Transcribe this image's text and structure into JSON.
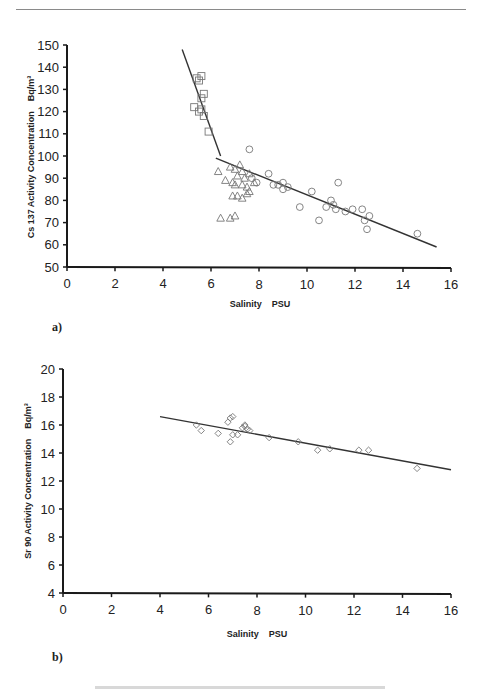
{
  "chart_data": [
    {
      "panel": "a)",
      "type": "scatter",
      "title": "",
      "xlabel": "Salinity    PSU",
      "ylabel": "Cs 137 Activity Concentration    Bq/m³",
      "xlim": [
        0,
        16
      ],
      "ylim": [
        50,
        150
      ],
      "xticks": [
        0,
        2,
        4,
        6,
        8,
        10,
        12,
        14,
        16
      ],
      "yticks": [
        50,
        60,
        70,
        80,
        90,
        100,
        110,
        120,
        130,
        140,
        150
      ],
      "grid": false,
      "legend": null,
      "series": [
        {
          "name": "squares",
          "marker": "square",
          "points": [
            [
              5.4,
              135
            ],
            [
              5.6,
              136
            ],
            [
              5.5,
              134
            ],
            [
              5.7,
              128
            ],
            [
              5.6,
              126
            ],
            [
              5.3,
              122
            ],
            [
              5.5,
              120
            ],
            [
              5.6,
              121
            ],
            [
              5.7,
              118
            ],
            [
              5.9,
              111
            ]
          ]
        },
        {
          "name": "triangles",
          "marker": "triangle",
          "points": [
            [
              6.3,
              93
            ],
            [
              6.8,
              95
            ],
            [
              7.0,
              94
            ],
            [
              7.2,
              96
            ],
            [
              7.3,
              93
            ],
            [
              6.6,
              89
            ],
            [
              6.9,
              88
            ],
            [
              7.0,
              87
            ],
            [
              7.3,
              87
            ],
            [
              7.5,
              86
            ],
            [
              6.4,
              72
            ],
            [
              6.8,
              72
            ],
            [
              7.0,
              73
            ],
            [
              7.1,
              82
            ],
            [
              7.3,
              81
            ],
            [
              7.5,
              83
            ],
            [
              6.9,
              82
            ],
            [
              7.6,
              84
            ],
            [
              7.8,
              88
            ],
            [
              7.1,
              91
            ],
            [
              7.6,
              92
            ],
            [
              7.4,
              90
            ]
          ]
        },
        {
          "name": "circles",
          "marker": "circle",
          "points": [
            [
              7.6,
              103
            ],
            [
              7.7,
              90
            ],
            [
              7.9,
              88
            ],
            [
              8.4,
              92
            ],
            [
              8.6,
              87
            ],
            [
              8.8,
              87
            ],
            [
              9.0,
              88
            ],
            [
              9.2,
              86
            ],
            [
              9.7,
              77
            ],
            [
              10.2,
              84
            ],
            [
              10.5,
              71
            ],
            [
              10.8,
              77
            ],
            [
              11.0,
              80
            ],
            [
              11.1,
              78
            ],
            [
              11.3,
              88
            ],
            [
              11.2,
              76
            ],
            [
              11.6,
              75
            ],
            [
              11.9,
              76
            ],
            [
              12.3,
              76
            ],
            [
              12.4,
              71
            ],
            [
              12.6,
              73
            ],
            [
              12.5,
              67
            ],
            [
              14.6,
              65
            ],
            [
              9.0,
              85
            ]
          ]
        }
      ],
      "fit_lines": [
        {
          "name": "upper segment",
          "from": [
            4.8,
            148
          ],
          "to": [
            6.4,
            100
          ]
        },
        {
          "name": "lower segment",
          "from": [
            6.2,
            99
          ],
          "to": [
            15.4,
            59
          ]
        }
      ]
    },
    {
      "panel": "b)",
      "type": "scatter",
      "title": "",
      "xlabel": "Salinity    PSU",
      "ylabel": "Sr 90 Activity Concentration    Bq/m³",
      "xlim": [
        0,
        16
      ],
      "ylim": [
        4,
        20
      ],
      "xticks": [
        0,
        2,
        4,
        6,
        8,
        10,
        12,
        14,
        16
      ],
      "yticks": [
        4,
        6,
        8,
        10,
        12,
        14,
        16,
        18,
        20
      ],
      "grid": false,
      "legend": null,
      "series": [
        {
          "name": "diamonds",
          "marker": "diamond",
          "points": [
            [
              5.5,
              16.0
            ],
            [
              5.7,
              15.6
            ],
            [
              6.4,
              15.4
            ],
            [
              6.8,
              16.2
            ],
            [
              6.9,
              16.5
            ],
            [
              7.0,
              16.6
            ],
            [
              7.0,
              15.3
            ],
            [
              7.2,
              15.3
            ],
            [
              6.9,
              14.8
            ],
            [
              7.4,
              15.8
            ],
            [
              7.5,
              15.9
            ],
            [
              7.6,
              15.7
            ],
            [
              7.7,
              15.6
            ],
            [
              7.5,
              16.0
            ],
            [
              8.5,
              15.1
            ],
            [
              9.7,
              14.8
            ],
            [
              10.5,
              14.2
            ],
            [
              11.0,
              14.3
            ],
            [
              12.2,
              14.2
            ],
            [
              12.6,
              14.2
            ],
            [
              14.6,
              12.9
            ]
          ]
        }
      ],
      "fit_lines": [
        {
          "name": "regression",
          "from": [
            4.0,
            16.6
          ],
          "to": [
            16.0,
            12.8
          ]
        }
      ]
    }
  ],
  "figure": {
    "panel_a_label": "a)",
    "panel_b_label": "b)",
    "chart_a": {
      "ylabel_main": "Cs 137 Activity Concentration",
      "ylabel_unit": "Bq/m³",
      "xlabel_main": "Salinity",
      "xlabel_unit": "PSU",
      "yticks": [
        "50",
        "60",
        "70",
        "80",
        "90",
        "100",
        "110",
        "120",
        "130",
        "140",
        "150"
      ],
      "xticks": [
        "0",
        "2",
        "4",
        "6",
        "8",
        "10",
        "12",
        "14",
        "16"
      ]
    },
    "chart_b": {
      "ylabel_main": "Sr 90 Activity Concentration",
      "ylabel_unit": "Bq/m³",
      "xlabel_main": "Salinity",
      "xlabel_unit": "PSU",
      "yticks": [
        "4",
        "6",
        "8",
        "10",
        "12",
        "14",
        "16",
        "18",
        "20"
      ],
      "xticks": [
        "0",
        "2",
        "4",
        "6",
        "8",
        "10",
        "12",
        "14",
        "16"
      ]
    }
  },
  "colors": {
    "axis": "#1a1a1a",
    "markers": "#777777",
    "fit_line": "#333333",
    "rule": "#8a8a8a"
  }
}
